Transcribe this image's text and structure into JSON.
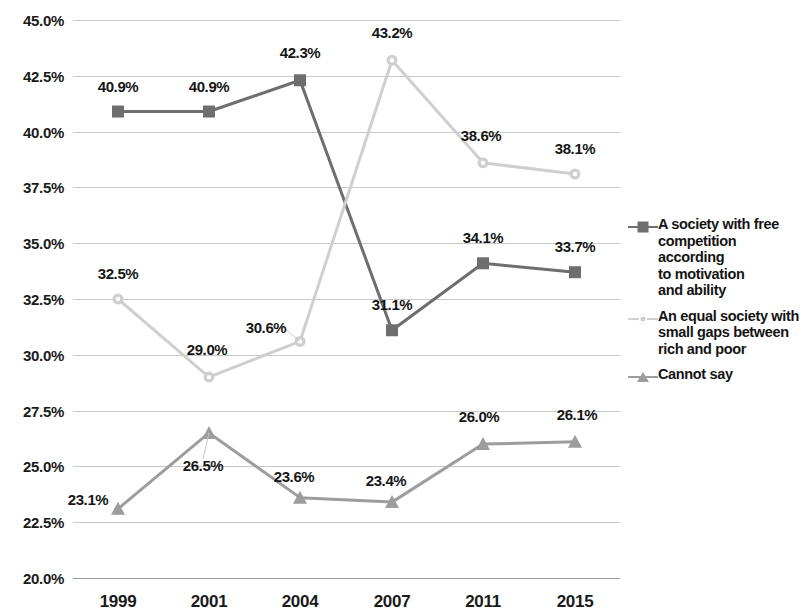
{
  "chart_data": {
    "type": "line",
    "title": "",
    "subtitle": "",
    "xlabel": "",
    "ylabel": "",
    "categories": [
      "1999",
      "2001",
      "2004",
      "2007",
      "2011",
      "2015"
    ],
    "ylim": [
      20.0,
      45.0
    ],
    "ytick_step": 2.5,
    "ytick_labels": [
      "45.0%",
      "42.5%",
      "40.0%",
      "37.5%",
      "35.0%",
      "32.5%",
      "30.0%",
      "27.5%",
      "25.0%",
      "22.5%",
      "20.0%"
    ],
    "ytick_values": [
      45.0,
      42.5,
      40.0,
      37.5,
      35.0,
      32.5,
      30.0,
      27.5,
      25.0,
      22.5,
      20.0
    ],
    "grid": true,
    "legend_position": "right",
    "value_suffix": "%",
    "series": [
      {
        "name": "A society with free competition according to motivation and ability",
        "marker": "square",
        "color": "#6e6e6e",
        "line_color": "#6e6e6e",
        "values": [
          40.9,
          40.9,
          42.3,
          31.1,
          34.1,
          33.7
        ],
        "labels": [
          "40.9%",
          "40.9%",
          "42.3%",
          "31.1%",
          "34.1%",
          "33.7%"
        ]
      },
      {
        "name": "An equal society with small gaps between rich and poor",
        "marker": "circle",
        "color": "#cfcfcf",
        "line_color": "#cfcfcf",
        "values": [
          32.5,
          29.0,
          30.6,
          43.2,
          38.6,
          38.1
        ],
        "labels": [
          "32.5%",
          "29.0%",
          "30.6%",
          "43.2%",
          "38.6%",
          "38.1%"
        ]
      },
      {
        "name": "Cannot say",
        "marker": "triangle",
        "color": "#9d9d9d",
        "line_color": "#9d9d9d",
        "values": [
          23.1,
          26.5,
          23.6,
          23.4,
          26.0,
          26.1
        ],
        "labels": [
          "23.1%",
          "26.5%",
          "23.6%",
          "23.4%",
          "26.0%",
          "26.1%"
        ]
      }
    ]
  },
  "legend": {
    "items": [
      {
        "label": "A society with free competition according to motivation and ability",
        "lines": [
          "A society with free",
          "competition according",
          "to motivation",
          "and ability"
        ],
        "marker": "square",
        "color": "#6e6e6e"
      },
      {
        "label": "An equal society with small gaps between rich and poor",
        "lines": [
          "An equal society with",
          "small gaps between",
          "rich and poor"
        ],
        "marker": "circle",
        "color": "#cfcfcf"
      },
      {
        "label": "Cannot say",
        "lines": [
          "Cannot say"
        ],
        "marker": "triangle",
        "color": "#9d9d9d"
      }
    ]
  }
}
